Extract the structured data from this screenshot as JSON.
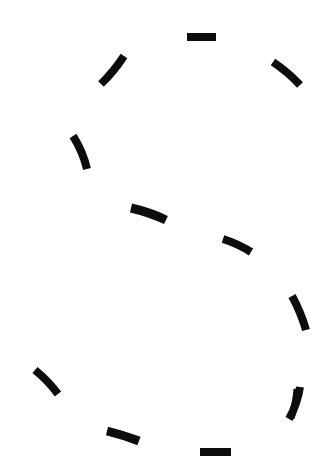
{
  "canvas": {
    "width": 330,
    "height": 470,
    "background_color": "#ffffff",
    "title": "Dashed Stroke Figure",
    "description": "Twelve short black brush dashes arranged around an open figure-eight outline on a blank white field."
  },
  "figure": {
    "name": "dashed-figure-eight-outline",
    "stroke_color": "#0d0d0d",
    "stroke_count": 12,
    "strokes": [
      {
        "id": "stroke-top",
        "label": "top horizontal dash",
        "x1": 187,
        "y1": 37,
        "x2": 216,
        "y2": 37,
        "width": 8,
        "angle_deg": 0,
        "curve_bow": 0
      },
      {
        "id": "stroke-upper-left",
        "label": "upper-left rising dash",
        "x1": 101,
        "y1": 84,
        "x2": 124,
        "y2": 56,
        "width": 8,
        "angle_deg": -50,
        "curve_bow": 2
      },
      {
        "id": "stroke-upper-right",
        "label": "upper-right descending dash",
        "x1": 273,
        "y1": 62,
        "x2": 300,
        "y2": 85,
        "width": 8,
        "angle_deg": 40,
        "curve_bow": -2
      },
      {
        "id": "stroke-left-upper-mid",
        "label": "left upper-middle steep dash",
        "x1": 73,
        "y1": 136,
        "x2": 87,
        "y2": 169,
        "width": 8,
        "angle_deg": 67,
        "curve_bow": -3
      },
      {
        "id": "stroke-center-left",
        "label": "center-left near-horizontal dash",
        "x1": 131,
        "y1": 208,
        "x2": 166,
        "y2": 220,
        "width": 9,
        "angle_deg": 19,
        "curve_bow": -2
      },
      {
        "id": "stroke-center-right",
        "label": "center-right near-horizontal dash",
        "x1": 223,
        "y1": 239,
        "x2": 251,
        "y2": 252,
        "width": 8,
        "angle_deg": 25,
        "curve_bow": -2
      },
      {
        "id": "stroke-right-mid",
        "label": "right middle steep dash",
        "x1": 292,
        "y1": 296,
        "x2": 306,
        "y2": 330,
        "width": 8,
        "angle_deg": 68,
        "curve_bow": -2
      },
      {
        "id": "stroke-left-lower",
        "label": "lower-left descending dash",
        "x1": 35,
        "y1": 370,
        "x2": 58,
        "y2": 394,
        "width": 8,
        "angle_deg": 46,
        "curve_bow": -2
      },
      {
        "id": "stroke-right-lower",
        "label": "lower-right falling dash",
        "x1": 300,
        "y1": 387,
        "x2": 289,
        "y2": 419,
        "width": 8,
        "angle_deg": 109,
        "curve_bow": -3
      },
      {
        "id": "stroke-bottom-left",
        "label": "bottom-left near-horizontal dash",
        "x1": 107,
        "y1": 431,
        "x2": 139,
        "y2": 441,
        "width": 9,
        "angle_deg": 17,
        "curve_bow": -1
      },
      {
        "id": "stroke-bottom",
        "label": "bottom horizontal dash",
        "x1": 200,
        "y1": 452,
        "x2": 231,
        "y2": 452,
        "width": 8,
        "angle_deg": 0,
        "curve_bow": 0
      },
      {
        "id": "stroke-bottom-right-tail",
        "label": "bottom-right tail dash",
        "x1": 297,
        "y1": 389,
        "x2": 291,
        "y2": 418,
        "width": 7,
        "angle_deg": 102,
        "curve_bow": -2
      }
    ]
  }
}
